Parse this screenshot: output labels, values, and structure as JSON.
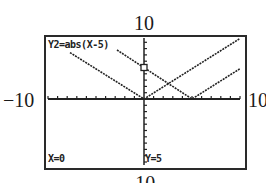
{
  "window": {
    "ymax_label": "10",
    "ymin_label": "−10",
    "xmin_label": "−10",
    "xmax_label": "10",
    "xmin": -10,
    "xmax": 10,
    "ymin": -10,
    "ymax": 10
  },
  "screen": {
    "function_label": "Y2=abs(X-5)",
    "x_readout": "X=0",
    "y_readout": "Y=5",
    "trace_cursor": {
      "x": 0,
      "y": 5
    }
  },
  "functions": [
    {
      "name": "Y1",
      "expression": "abs(X)",
      "vertex": [
        0,
        0
      ]
    },
    {
      "name": "Y2",
      "expression": "abs(X-5)",
      "vertex": [
        5,
        0
      ]
    }
  ],
  "colors": {
    "ink": "#222222",
    "background": "#ffffff"
  }
}
